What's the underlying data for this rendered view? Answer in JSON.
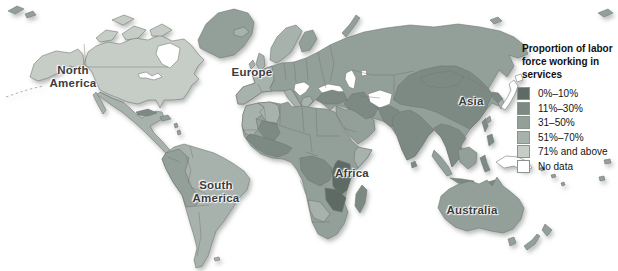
{
  "colors": {
    "cat_0_10": "#5e6b65",
    "cat_11_30": "#7d8a84",
    "cat_31_50": "#939f99",
    "cat_51_70": "#a8b2ac",
    "cat_71_above": "#c6cdc7",
    "no_data": "#ffffff",
    "border": "#6e736f",
    "label_text": "#3c3c3c"
  },
  "legend": {
    "title": "Proportion of labor\nforce working in\nservices",
    "items": [
      {
        "label": "0%–10%",
        "category": "cat_0_10"
      },
      {
        "label": "11%–30%",
        "category": "cat_11_30"
      },
      {
        "label": "31–50%",
        "category": "cat_31_50"
      },
      {
        "label": "51%–70%",
        "category": "cat_51_70"
      },
      {
        "label": "71% and above",
        "category": "cat_71_above"
      },
      {
        "label": "No data",
        "category": "no_data"
      }
    ]
  },
  "continent_labels": [
    {
      "id": "north-america",
      "text": "North\nAmerica"
    },
    {
      "id": "europe",
      "text": "Europe"
    },
    {
      "id": "asia",
      "text": "Asia"
    },
    {
      "id": "africa",
      "text": "Africa"
    },
    {
      "id": "south-america",
      "text": "South\nAmerica"
    },
    {
      "id": "australia",
      "text": "Australia"
    }
  ],
  "map": {
    "region_fills": {
      "arctic_nw": "cat_31_50",
      "alaska": "cat_71_above",
      "canada_usa": "cat_71_above",
      "arctic_islands": "cat_71_above",
      "hudson_bay": "no_data",
      "great_lakes": "no_data",
      "greenland": "cat_31_50",
      "iceland": "cat_51_70",
      "mexico_central_america": "cat_51_70",
      "baja": "cat_51_70",
      "cuba": "cat_11_30",
      "hispaniola": "cat_31_50",
      "antilles": "cat_31_50",
      "south_america": "cat_51_70",
      "andes_countries": "cat_31_50",
      "falklands": "cat_51_70",
      "uk": "cat_51_70",
      "ireland": "cat_51_70",
      "scandinavia": "cat_51_70",
      "finland": "cat_31_50",
      "eurasia": "cat_31_50",
      "west_europe": "cat_51_70",
      "italy": "cat_51_70",
      "greece": "cat_51_70",
      "balkans": "no_data",
      "black_sea": "no_data",
      "turkey": "cat_11_30",
      "caspian_sea": "no_data",
      "aral_sea": "no_data",
      "arabia": "cat_31_50",
      "iran": "cat_11_30",
      "afghanistan": "no_data",
      "pakistan": "cat_11_30",
      "india": "cat_11_30",
      "sri_lanka": "cat_11_30",
      "china_mongolia": "cat_11_30",
      "se_asia": "cat_11_30",
      "korea_north": "cat_11_30",
      "korea_south": "cat_51_70",
      "japan": "no_data",
      "taiwan": "cat_31_50",
      "philippines": "cat_11_30",
      "novaya_zemlya": "cat_31_50",
      "ne_islands": "cat_31_50",
      "africa": "cat_31_50",
      "morocco_wsahara": "cat_51_70",
      "algeria": "cat_51_70",
      "mali": "cat_11_30",
      "west_africa": "cat_11_30",
      "somalia": "cat_51_70",
      "east_africa": "cat_0_10",
      "drc": "cat_11_30",
      "zambia_zimbabwe_mozambique": "cat_0_10",
      "namibia_botswana": "cat_51_70",
      "madagascar": "cat_11_30",
      "sumatra": "cat_31_50",
      "borneo": "cat_31_50",
      "java": "cat_11_30",
      "sulawesi": "cat_11_30",
      "timor": "cat_11_30",
      "new_guinea": "no_data",
      "solomons": "cat_31_50",
      "australia": "cat_31_50",
      "tasmania": "cat_31_50",
      "new_zealand": "cat_31_50",
      "pacific_edge_islands": "cat_31_50"
    }
  }
}
